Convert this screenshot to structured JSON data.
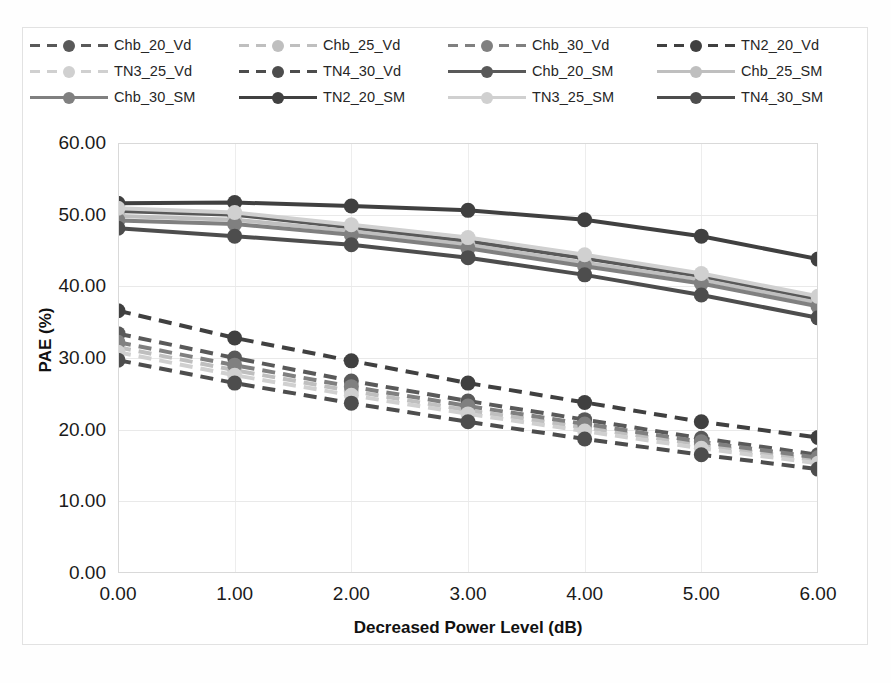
{
  "chart_data": {
    "type": "line",
    "title": "",
    "xlabel": "Decreased Power Level (dB)",
    "ylabel": "PAE (%)",
    "x": [
      0.0,
      1.0,
      2.0,
      3.0,
      4.0,
      5.0,
      6.0
    ],
    "xticklabels": [
      "0.00",
      "1.00",
      "2.00",
      "3.00",
      "4.00",
      "5.00",
      "6.00"
    ],
    "yticklabels": [
      "0.00",
      "10.00",
      "20.00",
      "30.00",
      "40.00",
      "50.00",
      "60.00"
    ],
    "yticks": [
      0,
      10,
      20,
      30,
      40,
      50,
      60
    ],
    "xlim": [
      0,
      6
    ],
    "ylim": [
      0,
      60
    ],
    "grid": true,
    "legend_position": "top",
    "marker": "circle",
    "series": [
      {
        "name": "Chb_20_Vd",
        "style": "dashed",
        "color": "#595959",
        "values": [
          33.4,
          30.0,
          26.8,
          24.0,
          21.4,
          18.8,
          16.5
        ]
      },
      {
        "name": "Chb_25_Vd",
        "style": "dashed",
        "color": "#bfbfbf",
        "values": [
          31.5,
          28.3,
          25.4,
          22.7,
          20.3,
          17.9,
          15.7
        ]
      },
      {
        "name": "Chb_30_Vd",
        "style": "dashed",
        "color": "#808080",
        "values": [
          32.2,
          29.0,
          26.0,
          23.3,
          20.8,
          18.3,
          16.1
        ]
      },
      {
        "name": "TN2_20_Vd",
        "style": "dashed",
        "color": "#404040",
        "values": [
          36.6,
          32.8,
          29.6,
          26.5,
          23.8,
          21.1,
          18.9
        ]
      },
      {
        "name": "TN3_25_Vd",
        "style": "dashed",
        "color": "#d0d0d0",
        "values": [
          30.8,
          27.6,
          24.8,
          22.2,
          19.8,
          17.4,
          15.3
        ]
      },
      {
        "name": "TN4_30_Vd",
        "style": "dashed",
        "color": "#4d4d4d",
        "values": [
          29.7,
          26.5,
          23.7,
          21.1,
          18.7,
          16.5,
          14.5
        ]
      },
      {
        "name": "Chb_20_SM",
        "style": "solid",
        "color": "#595959",
        "values": [
          50.5,
          50.0,
          48.2,
          46.3,
          43.9,
          41.4,
          38.2
        ]
      },
      {
        "name": "Chb_25_SM",
        "style": "solid",
        "color": "#bfbfbf",
        "values": [
          49.8,
          49.3,
          47.7,
          45.8,
          43.3,
          40.9,
          37.7
        ]
      },
      {
        "name": "Chb_30_SM",
        "style": "solid",
        "color": "#808080",
        "values": [
          49.2,
          48.7,
          47.2,
          45.3,
          42.8,
          40.4,
          37.2
        ]
      },
      {
        "name": "TN2_20_SM",
        "style": "solid",
        "color": "#404040",
        "values": [
          51.6,
          51.7,
          51.2,
          50.6,
          49.3,
          47.0,
          43.8
        ]
      },
      {
        "name": "TN3_25_SM",
        "style": "solid",
        "color": "#d0d0d0",
        "values": [
          50.9,
          50.3,
          48.6,
          46.8,
          44.4,
          41.8,
          38.6
        ]
      },
      {
        "name": "TN4_30_SM",
        "style": "solid",
        "color": "#4d4d4d",
        "values": [
          48.1,
          47.0,
          45.8,
          44.0,
          41.6,
          38.8,
          35.6
        ]
      }
    ],
    "legend": [
      "Chb_20_Vd",
      "Chb_25_Vd",
      "Chb_30_Vd",
      "TN2_20_Vd",
      "TN3_25_Vd",
      "TN4_30_Vd",
      "Chb_20_SM",
      "Chb_25_SM",
      "Chb_30_SM",
      "TN2_20_SM",
      "TN3_25_SM",
      "TN4_30_SM"
    ]
  }
}
